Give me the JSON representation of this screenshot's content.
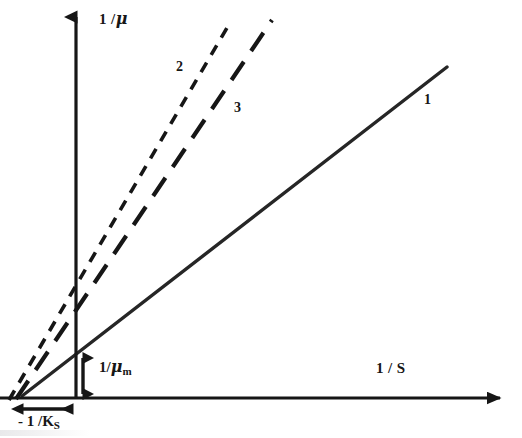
{
  "figure": {
    "background_color": "#ffffff",
    "ink_color": "#161616"
  },
  "axes": {
    "y_axis": {
      "name": "y-axis",
      "label": "1 /",
      "label_symbol": "μ",
      "full_label": "1 / μ",
      "x_px": 76,
      "top_px": 5,
      "bottom_px": 398,
      "arrowhead": "up"
    },
    "x_axis": {
      "name": "x-axis",
      "label": "1 / S",
      "label_numerator": "1 /",
      "label_symbol": "S",
      "y_px": 398,
      "left_px": 0,
      "right_px": 512,
      "arrowhead": "right"
    }
  },
  "annotations": {
    "y_intercept": {
      "label_prefix": "1/",
      "label_symbol": "μ",
      "label_subscript": "m",
      "full_label": "1/ μ m",
      "arrow": "double-headed-vertical",
      "from_px": [
        83,
        355
      ],
      "to_px": [
        83,
        397
      ],
      "value_meaning": "1/μ_m"
    },
    "x_intercept": {
      "label_prefix": "- 1 /",
      "label_symbol": "K",
      "label_subscript": "S",
      "full_label": "- 1 / K S",
      "arrow": "double-headed-horizontal",
      "from_px": [
        20,
        409
      ],
      "to_px": [
        76,
        409
      ],
      "value_meaning": "-1/K_S"
    }
  },
  "chart_data": {
    "type": "line",
    "title": "",
    "xlabel": "1 / S",
    "ylabel": "1 / μ",
    "grid": false,
    "legend": "inline-numbered",
    "axis_origin_px": [
      76,
      398
    ],
    "common_x_intercept_px": 22,
    "note": "Three straight lines sharing a common negative x-intercept (-1/K_S) and a common y-intercept (1/μ_m); slopes increase from series 1 to series 2.",
    "series": [
      {
        "name": "1",
        "label": "1",
        "style": "solid",
        "stroke_width": 3.4,
        "dash": "none",
        "label_pos_px": [
          424,
          93
        ],
        "points_px": [
          [
            22,
            396
          ],
          [
            447,
            67
          ]
        ],
        "slope_px": -0.774
      },
      {
        "name": "3",
        "label": "3",
        "style": "long-dash",
        "stroke_width": 4.2,
        "dash": "22 13",
        "label_pos_px": [
          234,
          101
        ],
        "points_px": [
          [
            16,
            399
          ],
          [
            272,
            20
          ]
        ],
        "slope_px": -1.48
      },
      {
        "name": "2",
        "label": "2",
        "style": "short-dash",
        "stroke_width": 3.6,
        "dash": "11 9",
        "label_pos_px": [
          176,
          60
        ],
        "points_px": [
          [
            9,
            400
          ],
          [
            231,
            21
          ]
        ],
        "slope_px": -1.71
      }
    ]
  }
}
